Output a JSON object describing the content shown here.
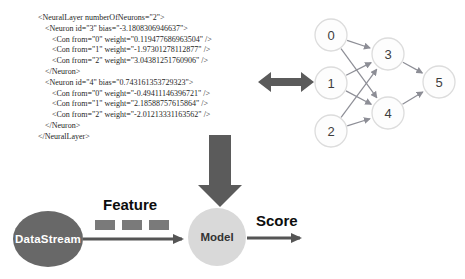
{
  "xml_panel": {
    "lines": [
      {
        "indent": 0,
        "text": "<NeuralLayer numberOfNeurons=\"2\">"
      },
      {
        "indent": 1,
        "text": "<Neuron id=\"3\" bias=\"-3.1808306946637\">"
      },
      {
        "indent": 2,
        "text": "<Con from=\"0\" weight=\"0.119477686963504\" />"
      },
      {
        "indent": 2,
        "text": "<Con from=\"1\" weight=\"-1.97301278112877\" />"
      },
      {
        "indent": 2,
        "text": "<Con from=\"2\" weight=\"3.04381251760906\" />"
      },
      {
        "indent": 1,
        "text": "</Neuron>"
      },
      {
        "indent": 1,
        "text": "<Neuron id=\"4\" bias=\"0.743161353729323\">"
      },
      {
        "indent": 2,
        "text": "<Con from=\"0\" weight=\"-0.49411146396721\" />"
      },
      {
        "indent": 2,
        "text": "<Con from=\"1\" weight=\"2.18588757615864\" />"
      },
      {
        "indent": 2,
        "text": "<Con from=\"2\" weight=\"-2.01213331163562\" />"
      },
      {
        "indent": 1,
        "text": "</Neuron>"
      },
      {
        "indent": 0,
        "text": "</NeuralLayer>"
      }
    ],
    "text_color": "#262626"
  },
  "network": {
    "nodes": [
      {
        "label": "0",
        "x": 31,
        "y": 27
      },
      {
        "label": "1",
        "x": 31,
        "y": 75
      },
      {
        "label": "2",
        "x": 31,
        "y": 123
      },
      {
        "label": "3",
        "x": 88,
        "y": 46
      },
      {
        "label": "4",
        "x": 88,
        "y": 105
      },
      {
        "label": "5",
        "x": 139,
        "y": 74
      }
    ],
    "edges": [
      [
        "0",
        "3"
      ],
      [
        "0",
        "4"
      ],
      [
        "1",
        "3"
      ],
      [
        "1",
        "4"
      ],
      [
        "2",
        "3"
      ],
      [
        "2",
        "4"
      ],
      [
        "3",
        "5"
      ],
      [
        "4",
        "5"
      ]
    ],
    "node_radius": 16,
    "node_fill": "#fdfdfd",
    "node_stroke": "#dcdcdc",
    "edge_color": "#8d8e96"
  },
  "connectors": {
    "double_arrow_color": "#5b5b5b",
    "down_arrow_color": "#5b5b5b"
  },
  "flow": {
    "datastream_label": "DataStream",
    "feature_label": "Feature",
    "model_label": "Model",
    "score_label": "Score",
    "datastream_fill": "#686868",
    "model_fill": "#d9d9d9",
    "arrow_color": "#555555",
    "dash_color": "#7a7a7a",
    "dash_count": 3
  }
}
